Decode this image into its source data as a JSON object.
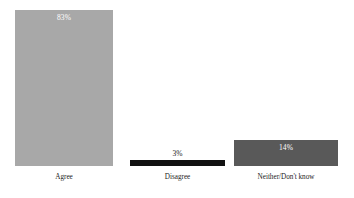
{
  "chart_data": {
    "type": "bar",
    "title": "",
    "subtitle": "",
    "xlabel": "",
    "ylabel": "",
    "categories": [
      "Agree",
      "Disagree",
      "Neither/Don't know"
    ],
    "values": [
      83,
      3,
      14
    ],
    "value_labels": [
      "83%",
      "3%",
      "14%"
    ],
    "ylim": [
      0,
      88
    ],
    "grid": false,
    "legend": false,
    "legend_position": "none",
    "axis_visible": false,
    "background_color": "#ffffff",
    "bar_colors": [
      "#a8a8a8",
      "#111111",
      "#595959"
    ],
    "value_label_colors": [
      "#ffffff",
      "#1a1a1a",
      "#ffffff"
    ],
    "value_label_placement": [
      "inside",
      "above",
      "inside"
    ],
    "category_label_color": "#1c1c1c"
  },
  "bars": [
    {
      "category": "Agree",
      "value": 83,
      "value_label": "83%",
      "color": "#a8a8a8",
      "label_color": "#ffffff",
      "label_placement": "inside"
    },
    {
      "category": "Disagree",
      "value": 3,
      "value_label": "3%",
      "color": "#111111",
      "label_color": "#1a1a1a",
      "label_placement": "above"
    },
    {
      "category": "Neither/Don't know",
      "value": 14,
      "value_label": "14%",
      "color": "#595959",
      "label_color": "#ffffff",
      "label_placement": "inside"
    }
  ]
}
